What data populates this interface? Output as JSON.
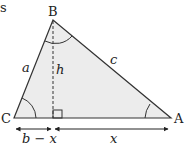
{
  "diagram": {
    "corner_text": "s",
    "vertices": {
      "B": {
        "label": "B",
        "x": 53,
        "y": 20
      },
      "C": {
        "label": "C",
        "x": 14,
        "y": 118
      },
      "A": {
        "label": "A",
        "x": 171,
        "y": 118
      }
    },
    "foot": {
      "x": 53,
      "y": 118
    },
    "sides": {
      "a": "a",
      "c": "c",
      "h": "h"
    },
    "segments": {
      "left": "b − x",
      "right": "x"
    },
    "colors": {
      "fill": "#ececec",
      "stroke": "#333333"
    }
  }
}
